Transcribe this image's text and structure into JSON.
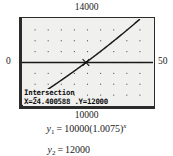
{
  "figure": {
    "kind": "graphing-calculator-screenshot",
    "axis_labels": {
      "top": "14000",
      "bottom": "10000",
      "left": "0",
      "right": "50"
    },
    "calculator": {
      "readout_title": "Intersection",
      "readout_coords": "X=24.400588  .Y=12000",
      "x_value": "24.400588",
      "y_value": "12000"
    },
    "equations": [
      {
        "lhs_var": "y",
        "lhs_sub": "1",
        "eq": "=",
        "rhs_coefficient": "10000(1.0075)",
        "rhs_exponent": "x",
        "full": "y1 = 10000(1.0075)^x"
      },
      {
        "lhs_var": "y",
        "lhs_sub": "2",
        "eq": "=",
        "rhs_coefficient": "12000",
        "rhs_exponent": "",
        "full": "y2 = 12000"
      }
    ],
    "colors": {
      "screen_background": "#f0f0ee",
      "frame": "#2b2b2b",
      "curve": "#1a1a1a",
      "text": "#1a1a1a"
    }
  },
  "chart_data": {
    "type": "line",
    "title": "",
    "xlabel": "",
    "ylabel": "",
    "xlim": [
      0,
      50
    ],
    "ylim": [
      10000,
      14000
    ],
    "grid": "dot-grid",
    "grid_x_step": 5,
    "grid_y_step": 500,
    "legend": "none",
    "annotations": [
      {
        "text": "Intersection",
        "x": 24.400588,
        "y": 12000
      },
      {
        "text": "X=24.400588  .Y=12000",
        "x": 24.400588,
        "y": 12000
      }
    ],
    "series": [
      {
        "name": "y1 = 10000(1.0075)^x",
        "type": "exponential",
        "a": 10000,
        "b": 1.0075,
        "x": [
          0,
          5,
          10,
          15,
          20,
          24.400588,
          25,
          30,
          35,
          40,
          45,
          50
        ],
        "values": [
          10000,
          10381,
          10776,
          11186,
          11612,
          12000,
          12054,
          12513,
          12988,
          13483,
          13995,
          14526
        ]
      },
      {
        "name": "y2 = 12000",
        "type": "horizontal-line",
        "x": [
          0,
          50
        ],
        "values": [
          12000,
          12000
        ]
      }
    ],
    "intersection": {
      "x": 24.400588,
      "y": 12000
    }
  }
}
